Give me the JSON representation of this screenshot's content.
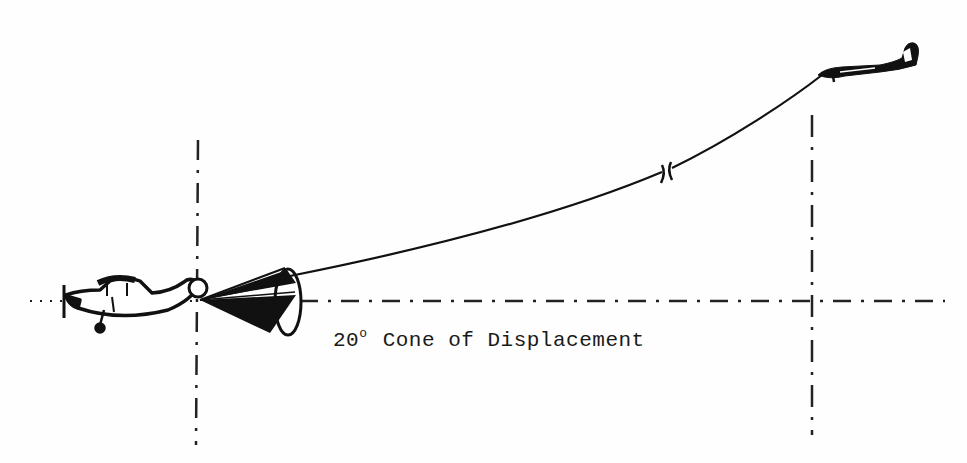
{
  "diagram": {
    "caption": {
      "angle": "20",
      "degree_symbol": "o",
      "text": "Cone of Displacement"
    },
    "elements": {
      "towed_aircraft": "small high-wing propeller aircraft (left)",
      "drogue": "conical drogue/parachute behind towed aircraft",
      "tow_line": "curved tow cable with break marks",
      "tow_aircraft": "tow aircraft (upper right)",
      "reference_lines": [
        "horizontal dash-dot centerline",
        "vertical dash-dot line at drogue",
        "vertical dash-dot line at tow aircraft"
      ]
    },
    "colors": {
      "ink": "#111111",
      "background": "#fefefe"
    }
  }
}
